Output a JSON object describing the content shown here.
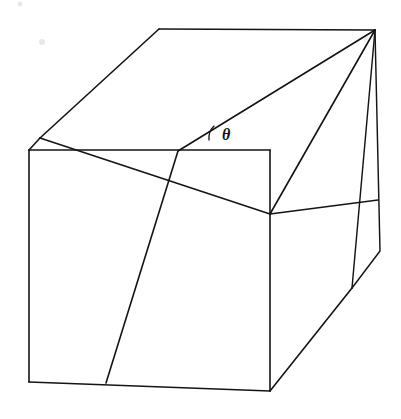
{
  "figure": {
    "type": "line-drawing",
    "canvas": {
      "width": 401,
      "height": 419,
      "background": "#ffffff"
    },
    "stroke_color": "#141414",
    "stroke_width": 1.6,
    "labels": {
      "theta": "θ",
      "theta_name": "angle-theta",
      "theta_position": {
        "x": 222,
        "y": 140
      }
    },
    "arc": {
      "name": "angle-arc",
      "path": "M 214 126 A 17 17 0 0 0 209 140",
      "center": {
        "x": 197,
        "y": 140
      },
      "radius": 17
    },
    "vertices": {
      "top_back_left": {
        "x": 159,
        "y": 29
      },
      "apex_top_right": {
        "x": 375,
        "y": 30
      },
      "left_upper_fold": {
        "x": 40,
        "y": 138
      },
      "front_top_left": {
        "x": 29,
        "y": 150
      },
      "front_top_right": {
        "x": 270,
        "y": 150
      },
      "front_bottom_left": {
        "x": 29,
        "y": 382
      },
      "front_bottom_right": {
        "x": 270,
        "y": 391
      },
      "crease_top": {
        "x": 178,
        "y": 151
      },
      "crease_bottom": {
        "x": 106,
        "y": 383
      },
      "right_mid_junction": {
        "x": 270,
        "y": 214
      },
      "right_side_lower": {
        "x": 352,
        "y": 288
      },
      "right_edge_kink": {
        "x": 380,
        "y": 251
      },
      "right_upper_mid": {
        "x": 378,
        "y": 200
      }
    },
    "edges": [
      {
        "name": "top-face-back-edge",
        "path": "M 159 29 L 375 30"
      },
      {
        "name": "top-face-left-edge",
        "path": "M 159 29 L 40 138"
      },
      {
        "name": "left-fold-to-corner",
        "path": "M 40 138 L 29 150"
      },
      {
        "name": "front-face-top-edge",
        "path": "M 29 150 L 270 150"
      },
      {
        "name": "front-face-left-edge",
        "path": "M 29 150 L 29 382"
      },
      {
        "name": "front-face-bottom-edge",
        "path": "M 29 382 L 270 391"
      },
      {
        "name": "front-face-right-edge",
        "path": "M 270 150 L 270 391"
      },
      {
        "name": "wedge-fold-line",
        "path": "M 178 151 L 375 30"
      },
      {
        "name": "wedge-lower-crease",
        "path": "M 40 138 L 270 214"
      },
      {
        "name": "vertical-crease-left",
        "path": "M 178 151 L 106 383"
      },
      {
        "name": "right-panel-upper-slant",
        "path": "M 375 30 L 270 214"
      },
      {
        "name": "right-panel-inner-line",
        "path": "M 375 30 L 352 288"
      },
      {
        "name": "right-outer-edge",
        "path": "M 375 30 L 380 251 L 352 288"
      },
      {
        "name": "bottom-right-slant",
        "path": "M 270 391 L 352 288"
      },
      {
        "name": "right-mid-horizontal",
        "path": "M 270 214 L 378 200"
      }
    ]
  }
}
